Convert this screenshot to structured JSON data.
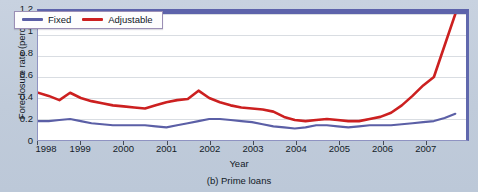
{
  "figure": {
    "caption": "(b) Prime loans",
    "background_color": "#c3cedd",
    "plot_background_color": "#ffffff",
    "frame_color": "#5d63ab"
  },
  "legend": {
    "position": "top-left",
    "entries": [
      {
        "label": "Fixed",
        "color": "#5b5fa6"
      },
      {
        "label": "Adjustable",
        "color": "#cc2020"
      }
    ]
  },
  "chart_data": {
    "type": "line",
    "title": "(b) Prime loans",
    "xlabel": "Year",
    "ylabel": "Foreclosure rate (percent)",
    "xlim": [
      1998,
      2008
    ],
    "ylim": [
      0,
      1.2
    ],
    "yticks": [
      "0",
      "0.2",
      "0.4",
      "0.6",
      "0.8",
      "1",
      "1.2"
    ],
    "ytick_values": [
      0,
      0.2,
      0.4,
      0.6,
      0.8,
      1,
      1.2
    ],
    "xticks": [
      "1998",
      "1999",
      "2000",
      "2001",
      "2002",
      "2003",
      "2004",
      "2005",
      "2006",
      "2007"
    ],
    "xtick_values": [
      1998,
      1999,
      2000,
      2001,
      2002,
      2003,
      2004,
      2005,
      2006,
      2007
    ],
    "grid": "horizontal",
    "legend_position": "upper left",
    "x": [
      1998.0,
      1998.25,
      1998.5,
      1998.75,
      1999.0,
      1999.25,
      1999.5,
      1999.75,
      2000.0,
      2000.25,
      2000.5,
      2000.75,
      2001.0,
      2001.25,
      2001.5,
      2001.75,
      2002.0,
      2002.25,
      2002.5,
      2002.75,
      2003.0,
      2003.25,
      2003.5,
      2003.75,
      2004.0,
      2004.25,
      2004.5,
      2004.75,
      2005.0,
      2005.25,
      2005.5,
      2005.75,
      2006.0,
      2006.25,
      2006.5,
      2006.75,
      2007.0,
      2007.25,
      2007.5,
      2007.75
    ],
    "series": [
      {
        "name": "Adjustable",
        "color": "#cc2020",
        "values": [
          0.45,
          0.42,
          0.38,
          0.45,
          0.4,
          0.37,
          0.35,
          0.33,
          0.32,
          0.31,
          0.3,
          0.33,
          0.36,
          0.38,
          0.39,
          0.47,
          0.4,
          0.36,
          0.33,
          0.31,
          0.3,
          0.29,
          0.27,
          0.22,
          0.19,
          0.18,
          0.19,
          0.2,
          0.19,
          0.18,
          0.18,
          0.2,
          0.22,
          0.26,
          0.33,
          0.42,
          0.52,
          0.6,
          0.9,
          1.2
        ]
      },
      {
        "name": "Fixed",
        "color": "#5b5fa6",
        "values": [
          0.18,
          0.18,
          0.19,
          0.2,
          0.18,
          0.16,
          0.15,
          0.14,
          0.14,
          0.14,
          0.14,
          0.13,
          0.12,
          0.14,
          0.16,
          0.18,
          0.2,
          0.2,
          0.19,
          0.18,
          0.17,
          0.15,
          0.13,
          0.12,
          0.11,
          0.12,
          0.14,
          0.14,
          0.13,
          0.12,
          0.13,
          0.14,
          0.14,
          0.14,
          0.15,
          0.16,
          0.17,
          0.18,
          0.21,
          0.25
        ]
      }
    ]
  }
}
